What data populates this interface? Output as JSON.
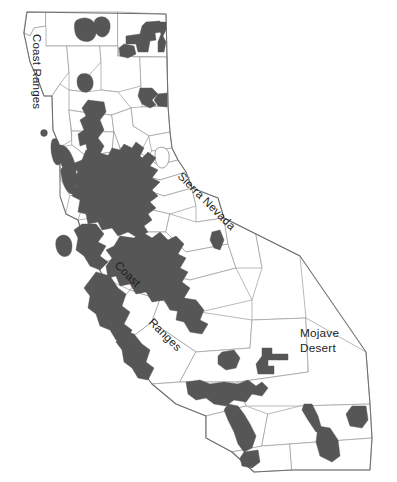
{
  "figure": {
    "type": "map",
    "width": 397,
    "height": 482,
    "background_color": "#ffffff"
  },
  "colors": {
    "highlight_fill": "#565656",
    "county_fill": "#ffffff",
    "county_stroke": "#9b9b9b",
    "state_stroke": "#6f6f6f",
    "label_text": "#1d1d1d"
  },
  "labels": {
    "coast_ranges_north": {
      "text": "Coast Ranges",
      "x": 33,
      "y": 34,
      "rotation": 90
    },
    "coast_ranges_central_word1": {
      "text": "Coast",
      "x": 114,
      "y": 266,
      "rotation": 45
    },
    "coast_ranges_central_word2": {
      "text": "Ranges",
      "x": 148,
      "y": 323,
      "rotation": 45
    },
    "sierra_nevada": {
      "text": "Sierra Nevada",
      "x": 177,
      "y": 177,
      "rotation": 45
    },
    "mojave_desert_line1": {
      "text": "Mojave",
      "x": 300,
      "y": 337
    },
    "mojave_desert_line2": {
      "text": "Desert",
      "x": 300,
      "y": 352
    }
  },
  "legend_note": {
    "highlight_meaning": "shaded counties"
  }
}
